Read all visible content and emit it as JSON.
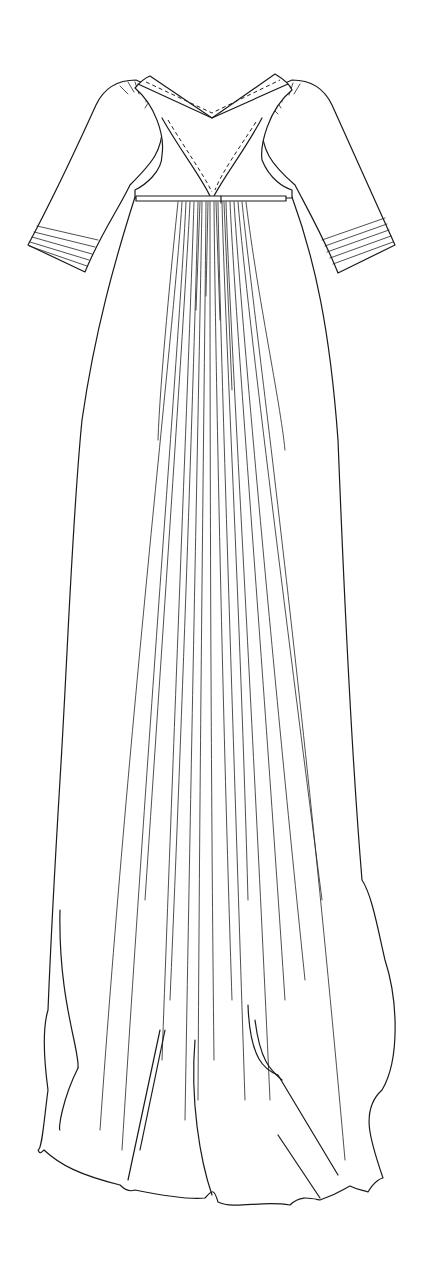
{
  "illustration": {
    "subject": "Technical line drawing of a long empire-waist gown",
    "background_color": "#ffffff",
    "line_color": "#1a1a1a",
    "features": [
      "V-neckline with top-stitched (dashed) edging",
      "Gathered sleeve heads",
      "Elbow-length sleeves with pin-tucked cuffs",
      "Narrow high-waist band",
      "Fine gathered pleats radiating from center waist",
      "Floor-length skirt with flowing, draped hem"
    ]
  }
}
